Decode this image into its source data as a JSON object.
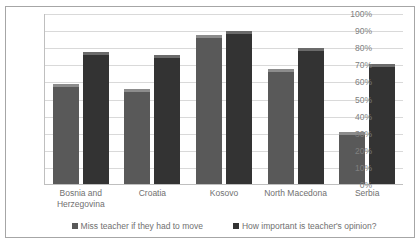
{
  "chart_data": {
    "type": "bar",
    "title": "",
    "xlabel": "",
    "ylabel": "",
    "ylim": [
      0,
      100
    ],
    "y_ticks": [
      "0%",
      "10%",
      "20%",
      "30%",
      "40%",
      "50%",
      "60%",
      "70%",
      "80%",
      "90%",
      "100%"
    ],
    "grid": true,
    "legend_position": "bottom",
    "categories": [
      "Bosnia and Herzegovina",
      "Croatia",
      "Kosovo",
      "North Macedona",
      "Serbia"
    ],
    "category_lines": [
      [
        "Bosnia and",
        "Herzegovina"
      ],
      [
        "Croatia"
      ],
      [
        "Kosovo"
      ],
      [
        "North Macedona"
      ],
      [
        "Serbia"
      ]
    ],
    "series": [
      {
        "name": "Miss teacher if they had to move",
        "color": "#595959",
        "values": [
          59,
          56,
          88,
          68,
          31
        ]
      },
      {
        "name": "How important is teacher's opinion?",
        "color": "#333333",
        "values": [
          78,
          76,
          90,
          80,
          71
        ]
      }
    ]
  }
}
